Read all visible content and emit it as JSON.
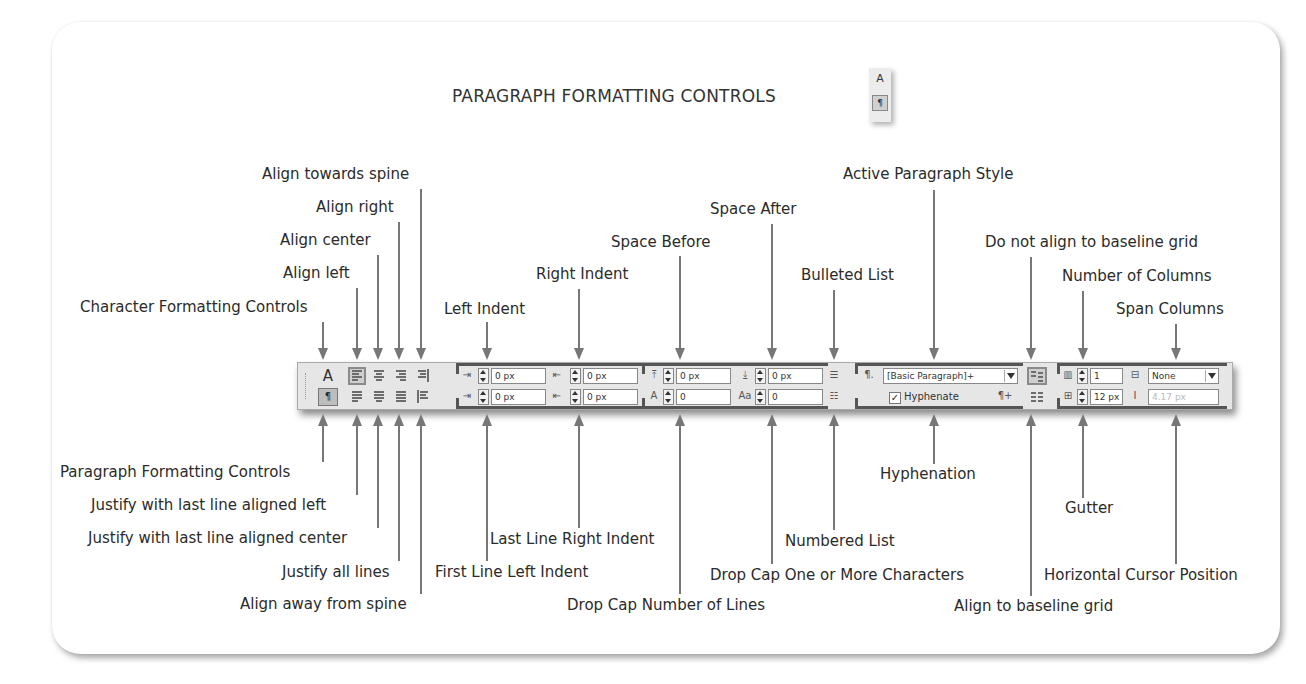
{
  "title": "PARAGRAPH FORMATTING CONTROLS",
  "title_icon": {
    "top_glyph": "A",
    "bottom_glyph": "¶"
  },
  "colors": {
    "arrow": "#777777",
    "toolbar_bg": "#e6e6e6",
    "group_border": "#555555",
    "text": "#2b2b2b"
  },
  "top_labels": [
    {
      "id": "character-formatting-controls",
      "text": "Character Formatting Controls"
    },
    {
      "id": "align-left",
      "text": "Align left"
    },
    {
      "id": "align-center",
      "text": "Align center"
    },
    {
      "id": "align-right",
      "text": "Align right"
    },
    {
      "id": "align-towards-spine",
      "text": "Align towards spine"
    },
    {
      "id": "left-indent",
      "text": "Left Indent"
    },
    {
      "id": "right-indent",
      "text": "Right Indent"
    },
    {
      "id": "space-before",
      "text": "Space Before"
    },
    {
      "id": "space-after",
      "text": "Space After"
    },
    {
      "id": "bulleted-list",
      "text": "Bulleted List"
    },
    {
      "id": "active-paragraph-style",
      "text": "Active Paragraph Style"
    },
    {
      "id": "do-not-align-baseline",
      "text": "Do not align to baseline grid"
    },
    {
      "id": "number-of-columns",
      "text": "Number of Columns"
    },
    {
      "id": "span-columns",
      "text": "Span Columns"
    }
  ],
  "bottom_labels": [
    {
      "id": "paragraph-formatting-controls",
      "text": "Paragraph Formatting Controls"
    },
    {
      "id": "justify-last-left",
      "text": "Justify with last line aligned left"
    },
    {
      "id": "justify-last-center",
      "text": "Justify with last line aligned center"
    },
    {
      "id": "justify-all",
      "text": "Justify all lines"
    },
    {
      "id": "align-away-spine",
      "text": "Align away from spine"
    },
    {
      "id": "first-line-left-indent",
      "text": "First Line Left Indent"
    },
    {
      "id": "last-line-right-indent",
      "text": "Last Line Right Indent"
    },
    {
      "id": "drop-cap-lines",
      "text": "Drop Cap Number of Lines"
    },
    {
      "id": "drop-cap-chars",
      "text": "Drop Cap One or More Characters"
    },
    {
      "id": "numbered-list",
      "text": "Numbered List"
    },
    {
      "id": "hyphenation",
      "text": "Hyphenation"
    },
    {
      "id": "align-to-baseline",
      "text": "Align to baseline grid"
    },
    {
      "id": "gutter",
      "text": "Gutter"
    },
    {
      "id": "horizontal-cursor-position",
      "text": "Horizontal Cursor Position"
    }
  ],
  "toolbar": {
    "char_mode_glyph": "A",
    "para_mode_glyph": "¶",
    "left_indent": "0 px",
    "first_line_indent": "0 px",
    "right_indent": "0 px",
    "last_line_right_indent": "0 px",
    "space_before": "0 px",
    "drop_cap_lines": "0",
    "space_after": "0 px",
    "drop_cap_chars": "0",
    "paragraph_style": "[Basic Paragraph]+",
    "hyphenate_label": "Hyphenate",
    "hyphenate_checked": "✓",
    "columns": "1",
    "gutter": "12 px",
    "span_columns": "None",
    "cursor_position": "4.17 px",
    "pilcrow_glyph": "¶.",
    "pilcrow_new_glyph": "¶+"
  }
}
